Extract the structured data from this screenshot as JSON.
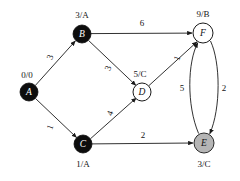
{
  "figure": {
    "name": "weighted-directed-graph",
    "background_color": "#ffffff",
    "ink_color": "#151515"
  },
  "graph_data": {
    "type": "directed-weighted-graph",
    "nodes": [
      {
        "id": "A",
        "letter": "A",
        "tag": "0/0",
        "tag_position": "above-left",
        "fill": "#0d0d0d",
        "letter_color": "#ffffff",
        "cx": 29,
        "cy": 92,
        "r": 9,
        "tag_x": 27,
        "tag_y": 75
      },
      {
        "id": "B",
        "letter": "B",
        "tag": "3/A",
        "tag_position": "above",
        "fill": "#0d0d0d",
        "letter_color": "#ffffff",
        "cx": 82,
        "cy": 34,
        "r": 9,
        "tag_x": 82,
        "tag_y": 15
      },
      {
        "id": "C",
        "letter": "C",
        "tag": "1/A",
        "tag_position": "below",
        "fill": "#0d0d0d",
        "letter_color": "#ffffff",
        "cx": 83,
        "cy": 144,
        "r": 9,
        "tag_x": 83,
        "tag_y": 164
      },
      {
        "id": "D",
        "letter": "D",
        "tag": "5/C",
        "tag_position": "above",
        "fill": "#ffffff",
        "letter_color": "#111111",
        "cx": 142,
        "cy": 92,
        "r": 9,
        "tag_x": 140,
        "tag_y": 74
      },
      {
        "id": "E",
        "letter": "E",
        "tag": "3/C",
        "tag_position": "below",
        "fill": "#b5b5b5",
        "letter_color": "#111111",
        "cx": 204,
        "cy": 143,
        "r": 10,
        "tag_x": 204,
        "tag_y": 164
      },
      {
        "id": "F",
        "letter": "F",
        "tag": "9/B",
        "tag_position": "above",
        "fill": "#ffffff",
        "letter_color": "#111111",
        "cx": 203,
        "cy": 33,
        "r": 10,
        "tag_x": 203,
        "tag_y": 14
      }
    ],
    "edges": [
      {
        "from": "A",
        "to": "B",
        "weight": "3",
        "label_x": 50,
        "label_y": 57,
        "label_rotation": -70,
        "shape": "straight"
      },
      {
        "from": "A",
        "to": "C",
        "weight": "1",
        "label_x": 50,
        "label_y": 127,
        "label_rotation": -70,
        "shape": "straight"
      },
      {
        "from": "B",
        "to": "F",
        "weight": "6",
        "label_x": 142,
        "label_y": 23,
        "label_rotation": 0,
        "shape": "straight"
      },
      {
        "from": "B",
        "to": "D",
        "weight": "3",
        "label_x": 108,
        "label_y": 68,
        "label_rotation": -70,
        "shape": "straight"
      },
      {
        "from": "C",
        "to": "D",
        "weight": "4",
        "label_x": 110,
        "label_y": 113,
        "label_rotation": -70,
        "shape": "straight"
      },
      {
        "from": "C",
        "to": "E",
        "weight": "2",
        "label_x": 143,
        "label_y": 135,
        "label_rotation": 0,
        "shape": "straight"
      },
      {
        "from": "D",
        "to": "F",
        "weight": "1",
        "label_x": 177,
        "label_y": 58,
        "label_rotation": -70,
        "shape": "straight"
      },
      {
        "from": "E",
        "to": "F",
        "weight": "5",
        "label_x": 182,
        "label_y": 88,
        "label_rotation": 0,
        "shape": "curve-left"
      },
      {
        "from": "F",
        "to": "E",
        "weight": "2",
        "label_x": 224,
        "label_y": 88,
        "label_rotation": 0,
        "shape": "curve-right"
      }
    ]
  }
}
